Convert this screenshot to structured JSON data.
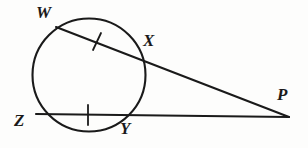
{
  "figure": {
    "kind": "geometry-diagram",
    "width": 308,
    "height": 148,
    "background_color": "#fdfdfc",
    "stroke_color": "#1a1a1a",
    "label_color": "#1a1a1a",
    "stroke_width": 2.1
  },
  "circle": {
    "name": "circle",
    "center_x": 89,
    "center_y": 75,
    "radius": 56.5
  },
  "points": [
    {
      "id": "W",
      "label": "W",
      "x": 56,
      "y": 27,
      "label_x": 36,
      "label_y": 4
    },
    {
      "id": "X",
      "label": "X",
      "x": 141,
      "y": 58,
      "label_x": 143,
      "label_y": 32
    },
    {
      "id": "Z",
      "label": "Z",
      "x": 36,
      "y": 114,
      "label_x": 14,
      "label_y": 112
    },
    {
      "id": "Y",
      "label": "Y",
      "x": 133,
      "y": 116,
      "label_x": 120,
      "label_y": 120
    },
    {
      "id": "P",
      "label": "P",
      "x": 289,
      "y": 117,
      "label_x": 277,
      "label_y": 86
    }
  ],
  "segments": [
    {
      "id": "WP",
      "label": "W to P secant",
      "x1": 56,
      "y1": 27,
      "x2": 289,
      "y2": 117
    },
    {
      "id": "ZP",
      "label": "Z to P secant",
      "x1": 36,
      "y1": 114,
      "x2": 289,
      "y2": 117
    }
  ],
  "tick_marks": [
    {
      "id": "tick-wx",
      "label": "congruence tick on chord WX",
      "x1": 101,
      "y1": 33,
      "x2": 93,
      "y2": 50
    },
    {
      "id": "tick-zy",
      "label": "congruence tick on chord ZY",
      "x1": 88,
      "y1": 105,
      "x2": 88,
      "y2": 125
    }
  ]
}
